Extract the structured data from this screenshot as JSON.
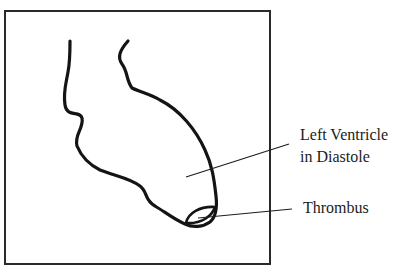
{
  "figure": {
    "frame": {
      "x": 5,
      "y": 11,
      "width": 265,
      "height": 253,
      "stroke": "#2a2a2a"
    },
    "ink_color": "#141414",
    "leader_color": "#1e1e1e",
    "labels": {
      "ventricle_line1": "Left Ventricle",
      "ventricle_line2": "in Diastole",
      "thrombus": "Thrombus"
    },
    "structures": [
      {
        "name": "left-ventricle",
        "state": "diastole"
      },
      {
        "name": "thrombus",
        "location": "apex"
      }
    ]
  }
}
